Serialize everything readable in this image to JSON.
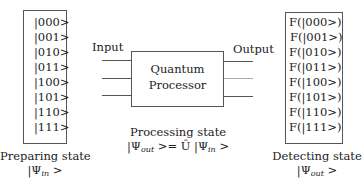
{
  "preparing": {
    "states": [
      "|000>",
      "|001>",
      "|010>",
      "|011>",
      "|100>",
      "|101>",
      "|110>",
      "|111>"
    ],
    "caption": "Preparing state",
    "psi": "|Ψ",
    "psi_sub": "in",
    "psi_end": " >"
  },
  "processor": {
    "input_label": "Input",
    "output_label": "Output",
    "title_line1": "Quantum",
    "title_line2": "Processor",
    "caption": "Processing state",
    "eq_psi_out": "|Ψ",
    "eq_sub_out": "out",
    "eq_mid": " >= Û |Ψ",
    "eq_sub_in": "in",
    "eq_end": " >"
  },
  "detecting": {
    "states": [
      "F(|000>)",
      "F(|001>)",
      "F(|010>)",
      "F(|011>)",
      "F(|100>)",
      "F(|101>)",
      "F(|110>)",
      "F(|111>)"
    ],
    "caption": "Detecting state",
    "psi": "|Ψ",
    "psi_sub": "out",
    "psi_end": " >"
  }
}
